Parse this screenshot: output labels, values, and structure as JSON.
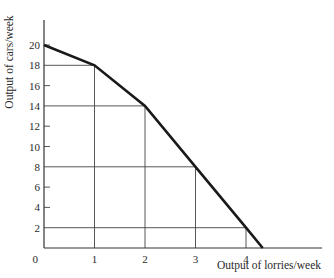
{
  "chart_data": {
    "type": "line",
    "title": "",
    "xlabel": "Output of lorries/week",
    "ylabel": "Output of cars/week",
    "x": [
      0,
      1,
      2,
      3,
      4,
      4.33
    ],
    "series": [
      {
        "name": "Production possibility frontier",
        "values": [
          20,
          18,
          14,
          8,
          2,
          0
        ]
      }
    ],
    "guide_points": [
      {
        "x": 1,
        "y": 18
      },
      {
        "x": 2,
        "y": 14
      },
      {
        "x": 3,
        "y": 8
      },
      {
        "x": 4,
        "y": 2
      }
    ],
    "x_ticks": [
      0,
      1,
      2,
      3,
      4
    ],
    "y_ticks": [
      2,
      4,
      6,
      8,
      10,
      12,
      14,
      16,
      18,
      20
    ],
    "origin_label": "0",
    "xlim": [
      0,
      5.6
    ],
    "ylim": [
      0,
      22.5
    ],
    "grid": false,
    "legend": "none"
  },
  "colors": {
    "curve": "#1a1a1a",
    "axis": "#333333",
    "guide": "#444444"
  }
}
